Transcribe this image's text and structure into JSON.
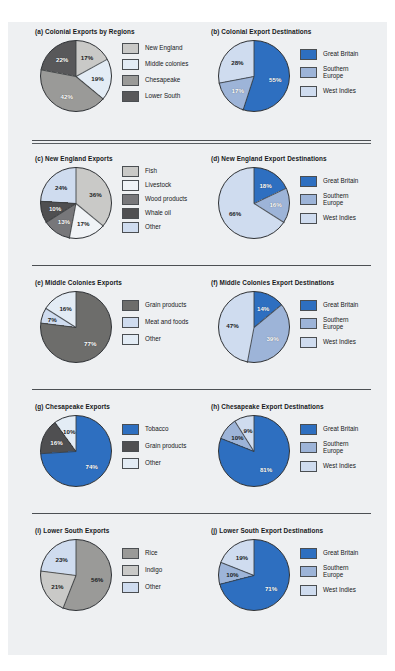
{
  "palette": {
    "gb_blue": "#2e6fc0",
    "se_blue": "#9db4d8",
    "wi_blue": "#cfdcef",
    "gray_light": "#c9c9c7",
    "gray_pale": "#e3ecf5",
    "gray_mid": "#9a9a98",
    "gray_dark": "#6d6d6b",
    "gray_darkest": "#58585a",
    "panel_bg": "#eef0f2",
    "rule": "#4c5054"
  },
  "chart_data": [
    {
      "id": "a",
      "type": "pie",
      "title": "(a) Colonial Exports by Regions",
      "categories": [
        "New England",
        "Middle colonies",
        "Chesapeake",
        "Lower South"
      ],
      "values": [
        17,
        19,
        42,
        22
      ],
      "labels": [
        "17%",
        "19%",
        "42%",
        "22%"
      ],
      "colors": [
        "#c9c9c7",
        "#e3ecf5",
        "#9a9a98",
        "#58585a"
      ],
      "label_dark": [
        true,
        true,
        false,
        false
      ]
    },
    {
      "id": "b",
      "type": "pie",
      "title": "(b) Colonial Export Destinations",
      "categories": [
        "Great Britain",
        "Southern\nEurope",
        "West Indies"
      ],
      "values": [
        55,
        17,
        28
      ],
      "labels": [
        "55%",
        "17%",
        "28%"
      ],
      "colors": [
        "#2e6fc0",
        "#9db4d8",
        "#cfdcef"
      ],
      "label_dark": [
        false,
        false,
        true
      ]
    },
    {
      "id": "c",
      "type": "pie",
      "title": "(c) New England Exports",
      "categories": [
        "Fish",
        "Livestock",
        "Wood products",
        "Whale oil",
        "Other"
      ],
      "values": [
        36,
        17,
        13,
        10,
        24
      ],
      "labels": [
        "36%",
        "17%",
        "13%",
        "10%",
        "24%"
      ],
      "colors": [
        "#c9c9c7",
        "#f0f3f6",
        "#77777a",
        "#4f4f51",
        "#cfdcef"
      ],
      "label_dark": [
        true,
        true,
        false,
        false,
        true
      ]
    },
    {
      "id": "d",
      "type": "pie",
      "title": "(d) New England Export Destinations",
      "categories": [
        "Great Britain",
        "Southern\nEurope",
        "West Indies"
      ],
      "values": [
        18,
        16,
        66
      ],
      "labels": [
        "18%",
        "16%",
        "66%"
      ],
      "colors": [
        "#2e6fc0",
        "#9db4d8",
        "#cfdcef"
      ],
      "label_dark": [
        false,
        false,
        true
      ]
    },
    {
      "id": "e",
      "type": "pie",
      "title": "(e) Middle Colonies Exports",
      "categories": [
        "Grain products",
        "Meat and foods",
        "Other"
      ],
      "values": [
        77,
        7,
        16
      ],
      "labels": [
        "77%",
        "7%",
        "16%"
      ],
      "colors": [
        "#6d6d6b",
        "#cfdcef",
        "#e3ecf5"
      ],
      "label_dark": [
        false,
        true,
        true
      ]
    },
    {
      "id": "f",
      "type": "pie",
      "title": "(f) Middle Colonies Export Destinations",
      "categories": [
        "Great Britain",
        "Southern\nEurope",
        "West Indies"
      ],
      "values": [
        14,
        39,
        47
      ],
      "labels": [
        "14%",
        "39%",
        "47%"
      ],
      "colors": [
        "#2e6fc0",
        "#9db4d8",
        "#cfdcef"
      ],
      "label_dark": [
        false,
        false,
        true
      ]
    },
    {
      "id": "g",
      "type": "pie",
      "title": "(g) Chesapeake Exports",
      "categories": [
        "Tobacco",
        "Grain products",
        "Other"
      ],
      "values": [
        74,
        16,
        10
      ],
      "labels": [
        "74%",
        "16%",
        "10%"
      ],
      "colors": [
        "#2e6fc0",
        "#4f4f51",
        "#e3ecf5"
      ],
      "label_dark": [
        false,
        false,
        true
      ]
    },
    {
      "id": "h",
      "type": "pie",
      "title": "(h) Chesapeake Export Destinations",
      "categories": [
        "Great Britain",
        "Southern\nEurope",
        "West Indies"
      ],
      "values": [
        81,
        10,
        9
      ],
      "labels": [
        "81%",
        "10%",
        "9%"
      ],
      "colors": [
        "#2e6fc0",
        "#9db4d8",
        "#cfdcef"
      ],
      "label_dark": [
        false,
        true,
        true
      ]
    },
    {
      "id": "i",
      "type": "pie",
      "title": "(i) Lower South Exports",
      "categories": [
        "Rice",
        "Indigo",
        "Other"
      ],
      "values": [
        56,
        21,
        23
      ],
      "labels": [
        "56%",
        "21%",
        "23%"
      ],
      "colors": [
        "#9a9a98",
        "#c9c9c7",
        "#cfdcef"
      ],
      "label_dark": [
        true,
        true,
        true
      ]
    },
    {
      "id": "j",
      "type": "pie",
      "title": "(j) Lower South Export Destinations",
      "categories": [
        "Great Britain",
        "Southern\nEurope",
        "West Indies"
      ],
      "values": [
        71,
        10,
        19
      ],
      "labels": [
        "71%",
        "10%",
        "19%"
      ],
      "colors": [
        "#2e6fc0",
        "#9db4d8",
        "#cfdcef"
      ],
      "label_dark": [
        false,
        true,
        true
      ]
    }
  ]
}
